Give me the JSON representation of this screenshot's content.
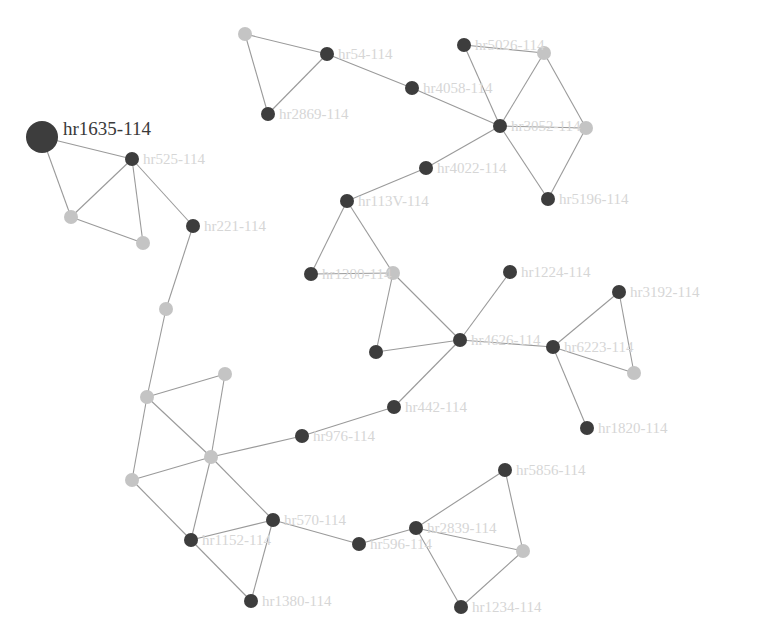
{
  "graph": {
    "highlighted_label": "hr1635-114",
    "colors": {
      "dark_node": "#3d3d3d",
      "light_node": "#c4c4c4",
      "edge": "#9a9a9a",
      "label": "#d6d6d6",
      "highlight_label": "#3a3a3a"
    },
    "nodes": [
      {
        "id": "n0",
        "x": 42,
        "y": 137,
        "r": 16,
        "type": "dark",
        "label": "hr1635-114",
        "highlight": true
      },
      {
        "id": "n1",
        "x": 132,
        "y": 159,
        "r": 7,
        "type": "dark",
        "label": "hr525-114"
      },
      {
        "id": "n2",
        "x": 71,
        "y": 217,
        "r": 7,
        "type": "light",
        "label": ""
      },
      {
        "id": "n3",
        "x": 143,
        "y": 243,
        "r": 7,
        "type": "light",
        "label": ""
      },
      {
        "id": "n4",
        "x": 193,
        "y": 226,
        "r": 7,
        "type": "dark",
        "label": "hr221-114"
      },
      {
        "id": "n5",
        "x": 166,
        "y": 309,
        "r": 7,
        "type": "light",
        "label": ""
      },
      {
        "id": "n6",
        "x": 147,
        "y": 397,
        "r": 7,
        "type": "light",
        "label": ""
      },
      {
        "id": "n7",
        "x": 225,
        "y": 374,
        "r": 7,
        "type": "light",
        "label": ""
      },
      {
        "id": "n8",
        "x": 211,
        "y": 457,
        "r": 7,
        "type": "light",
        "label": ""
      },
      {
        "id": "n9",
        "x": 132,
        "y": 480,
        "r": 7,
        "type": "light",
        "label": ""
      },
      {
        "id": "n10",
        "x": 302,
        "y": 436,
        "r": 7,
        "type": "dark",
        "label": "hr976-114"
      },
      {
        "id": "n11",
        "x": 191,
        "y": 540,
        "r": 7,
        "type": "dark",
        "label": "hr1152-114"
      },
      {
        "id": "n12",
        "x": 273,
        "y": 520,
        "r": 7,
        "type": "dark",
        "label": "hr570-114"
      },
      {
        "id": "n13",
        "x": 251,
        "y": 601,
        "r": 7,
        "type": "dark",
        "label": "hr1380-114"
      },
      {
        "id": "n14",
        "x": 359,
        "y": 544,
        "r": 7,
        "type": "dark",
        "label": "hr596-114"
      },
      {
        "id": "n15",
        "x": 245,
        "y": 34,
        "r": 7,
        "type": "light",
        "label": ""
      },
      {
        "id": "n16",
        "x": 327,
        "y": 54,
        "r": 7,
        "type": "dark",
        "label": "hr54-114"
      },
      {
        "id": "n17",
        "x": 268,
        "y": 114,
        "r": 7,
        "type": "dark",
        "label": "hr2869-114"
      },
      {
        "id": "n18",
        "x": 412,
        "y": 88,
        "r": 7,
        "type": "dark",
        "label": "hr4058-114"
      },
      {
        "id": "n19",
        "x": 464,
        "y": 45,
        "r": 7,
        "type": "dark",
        "label": "hr5026-114"
      },
      {
        "id": "n20",
        "x": 544,
        "y": 53,
        "r": 7,
        "type": "light",
        "label": ""
      },
      {
        "id": "n21",
        "x": 500,
        "y": 126,
        "r": 7,
        "type": "dark",
        "label": "hr3052-114"
      },
      {
        "id": "n22",
        "x": 586,
        "y": 128,
        "r": 7,
        "type": "light",
        "label": ""
      },
      {
        "id": "n23",
        "x": 426,
        "y": 168,
        "r": 7,
        "type": "dark",
        "label": "hr4022-114"
      },
      {
        "id": "n24",
        "x": 548,
        "y": 199,
        "r": 7,
        "type": "dark",
        "label": "hr5196-114"
      },
      {
        "id": "n25",
        "x": 347,
        "y": 201,
        "r": 7,
        "type": "dark",
        "label": "hr113V-114"
      },
      {
        "id": "n26",
        "x": 311,
        "y": 274,
        "r": 7,
        "type": "dark",
        "label": "hr1200-114"
      },
      {
        "id": "n27",
        "x": 393,
        "y": 273,
        "r": 7,
        "type": "light",
        "label": ""
      },
      {
        "id": "n28",
        "x": 510,
        "y": 272,
        "r": 7,
        "type": "dark",
        "label": "hr1224-114"
      },
      {
        "id": "n29",
        "x": 619,
        "y": 292,
        "r": 7,
        "type": "dark",
        "label": "hr3192-114"
      },
      {
        "id": "n30",
        "x": 460,
        "y": 340,
        "r": 7,
        "type": "dark",
        "label": "hr4626-114"
      },
      {
        "id": "n31",
        "x": 376,
        "y": 352,
        "r": 7,
        "type": "dark",
        "label": ""
      },
      {
        "id": "n32",
        "x": 553,
        "y": 347,
        "r": 7,
        "type": "dark",
        "label": "hr6223-114"
      },
      {
        "id": "n33",
        "x": 634,
        "y": 373,
        "r": 7,
        "type": "light",
        "label": ""
      },
      {
        "id": "n34",
        "x": 587,
        "y": 428,
        "r": 7,
        "type": "dark",
        "label": "hr1820-114"
      },
      {
        "id": "n35",
        "x": 394,
        "y": 407,
        "r": 7,
        "type": "dark",
        "label": "hr442-114"
      },
      {
        "id": "n36",
        "x": 505,
        "y": 470,
        "r": 7,
        "type": "dark",
        "label": "hr5856-114"
      },
      {
        "id": "n37",
        "x": 416,
        "y": 528,
        "r": 7,
        "type": "dark",
        "label": "hr2839-114"
      },
      {
        "id": "n38",
        "x": 523,
        "y": 551,
        "r": 7,
        "type": "light",
        "label": ""
      },
      {
        "id": "n39",
        "x": 461,
        "y": 607,
        "r": 7,
        "type": "dark",
        "label": "hr1234-114"
      }
    ],
    "edges": [
      [
        "n0",
        "n1"
      ],
      [
        "n0",
        "n2"
      ],
      [
        "n1",
        "n2"
      ],
      [
        "n1",
        "n3"
      ],
      [
        "n2",
        "n3"
      ],
      [
        "n1",
        "n4"
      ],
      [
        "n4",
        "n5"
      ],
      [
        "n5",
        "n6"
      ],
      [
        "n6",
        "n7"
      ],
      [
        "n6",
        "n8"
      ],
      [
        "n6",
        "n9"
      ],
      [
        "n7",
        "n8"
      ],
      [
        "n8",
        "n9"
      ],
      [
        "n8",
        "n10"
      ],
      [
        "n8",
        "n11"
      ],
      [
        "n8",
        "n12"
      ],
      [
        "n9",
        "n11"
      ],
      [
        "n11",
        "n12"
      ],
      [
        "n11",
        "n13"
      ],
      [
        "n12",
        "n13"
      ],
      [
        "n12",
        "n14"
      ],
      [
        "n14",
        "n37"
      ],
      [
        "n10",
        "n35"
      ],
      [
        "n35",
        "n30"
      ],
      [
        "n15",
        "n16"
      ],
      [
        "n15",
        "n17"
      ],
      [
        "n16",
        "n17"
      ],
      [
        "n16",
        "n18"
      ],
      [
        "n18",
        "n21"
      ],
      [
        "n19",
        "n20"
      ],
      [
        "n19",
        "n21"
      ],
      [
        "n20",
        "n21"
      ],
      [
        "n20",
        "n22"
      ],
      [
        "n21",
        "n22"
      ],
      [
        "n21",
        "n24"
      ],
      [
        "n22",
        "n24"
      ],
      [
        "n21",
        "n23"
      ],
      [
        "n23",
        "n25"
      ],
      [
        "n25",
        "n26"
      ],
      [
        "n25",
        "n27"
      ],
      [
        "n26",
        "n27"
      ],
      [
        "n27",
        "n31"
      ],
      [
        "n27",
        "n30"
      ],
      [
        "n31",
        "n30"
      ],
      [
        "n28",
        "n30"
      ],
      [
        "n30",
        "n32"
      ],
      [
        "n32",
        "n29"
      ],
      [
        "n32",
        "n33"
      ],
      [
        "n29",
        "n33"
      ],
      [
        "n32",
        "n34"
      ],
      [
        "n36",
        "n37"
      ],
      [
        "n36",
        "n38"
      ],
      [
        "n37",
        "n38"
      ],
      [
        "n37",
        "n39"
      ],
      [
        "n38",
        "n39"
      ]
    ]
  }
}
